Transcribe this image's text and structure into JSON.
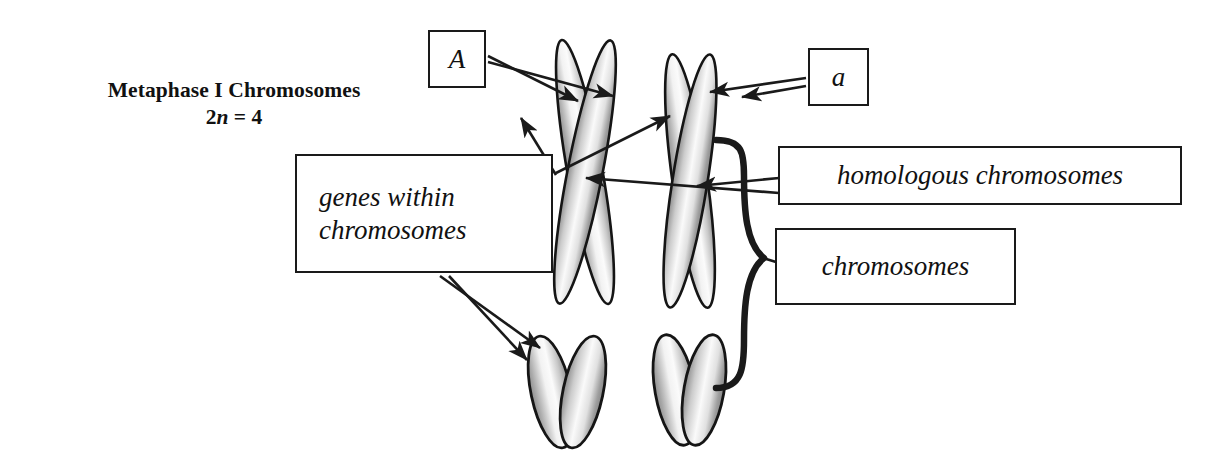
{
  "figure": {
    "domain": "Diagram",
    "background_color": "#ffffff",
    "ink_color": "#1a1a1a",
    "width": 1224,
    "height": 475
  },
  "title": {
    "line1": "Metaphase I Chromosomes",
    "ploidy_prefix": "2",
    "ploidy_variable": "n",
    "ploidy_suffix": " = 4"
  },
  "labels": {
    "allele_dominant": "A",
    "allele_recessive": "a",
    "genes_within_chromosomes_line1": "genes within",
    "genes_within_chromosomes_line2": "chromosomes",
    "homologous_chromosomes": "homologous chromosomes",
    "chromosomes": "chromosomes"
  },
  "chromosomes": [
    {
      "name": "long-homolog-left",
      "shape": "X",
      "centromere": [
        585,
        172
      ],
      "chromatids": 2,
      "allele": "A"
    },
    {
      "name": "long-homolog-right",
      "shape": "X",
      "centromere": [
        690,
        183
      ],
      "chromatids": 2,
      "allele": "a"
    },
    {
      "name": "short-homolog-left",
      "shape": "V",
      "centromere": [
        565,
        338
      ],
      "chromatids": 2,
      "allele": ""
    },
    {
      "name": "short-homolog-right",
      "shape": "V",
      "centromere": [
        688,
        336
      ],
      "chromatids": 2,
      "allele": ""
    }
  ],
  "connectors": [
    {
      "from": "allele-A-box",
      "to": "left-homolog-chromatid-1"
    },
    {
      "from": "allele-A-box",
      "to": "left-homolog-chromatid-2"
    },
    {
      "from": "allele-a-box",
      "to": "right-homolog-chromatid-1"
    },
    {
      "from": "allele-a-box",
      "to": "right-homolog-chromatid-2"
    },
    {
      "from": "genes-within-chromosomes-box",
      "to": "left-homolog-chromatid"
    },
    {
      "from": "genes-within-chromosomes-box",
      "to": "right-homolog-chromatid"
    },
    {
      "from": "genes-within-chromosomes-box",
      "to": "short-left-chromatid-1"
    },
    {
      "from": "genes-within-chromosomes-box",
      "to": "short-left-chromatid-2"
    },
    {
      "from": "homologous-chromosomes-box",
      "to": "left-homolog-centromere"
    },
    {
      "from": "homologous-chromosomes-box",
      "to": "right-homolog-centromere"
    },
    {
      "from": "brace",
      "to": "chromosomes-box"
    }
  ],
  "brace": {
    "name": "right-curly-brace",
    "top": 138,
    "bottom": 390,
    "tip_x": 775,
    "tip_y": 258,
    "groups": "all four chromosomes"
  }
}
